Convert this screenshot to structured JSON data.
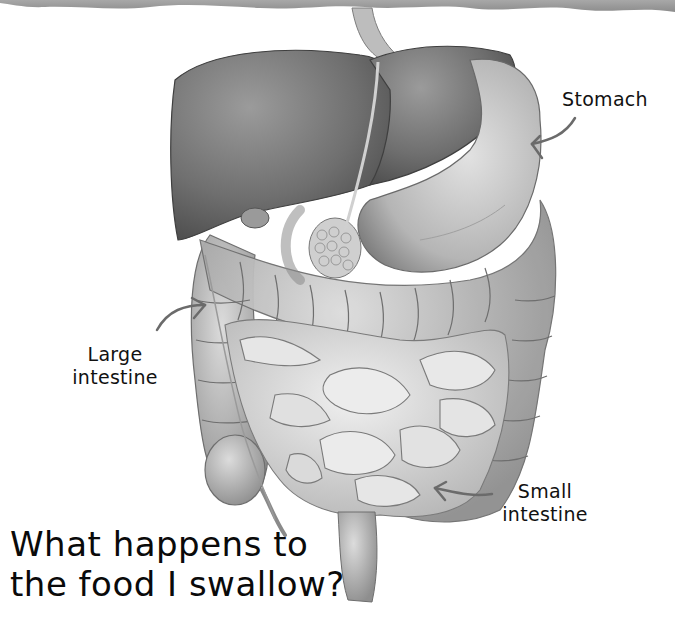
{
  "header_band": {
    "color": "#9a9a9a"
  },
  "labels": {
    "stomach": "Stomach",
    "large_intestine_line1": "Large",
    "large_intestine_line2": "intestine",
    "small_intestine_line1": "Small",
    "small_intestine_line2": "intestine"
  },
  "title": {
    "line1": "What happens to",
    "line2": "the food I swallow?"
  },
  "illustration": {
    "subject": "digestive-system",
    "organs": [
      "esophagus",
      "liver",
      "stomach",
      "pancreas",
      "large-intestine",
      "small-intestine",
      "rectum"
    ]
  }
}
